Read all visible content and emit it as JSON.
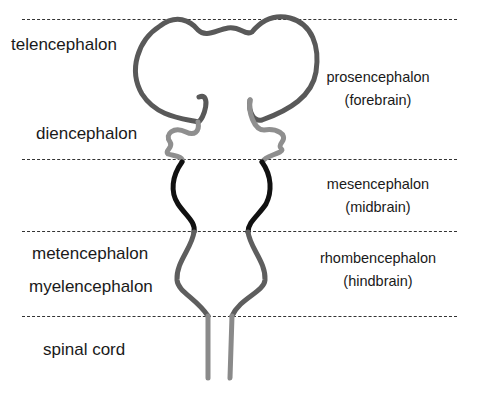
{
  "left_labels": {
    "telencephalon": "telencephalon",
    "diencephalon": "diencephalon",
    "metencephalon": "metencephalon",
    "myelencephalon": "myelencephalon",
    "spinal_cord": "spinal cord"
  },
  "right_labels": {
    "prosencephalon": {
      "name": "prosencephalon",
      "common": "(forebrain)"
    },
    "mesencephalon": {
      "name": "mesencephalon",
      "common": "(midbrain)"
    },
    "rhombencephalon": {
      "name": "rhombencephalon",
      "common": "(hindbrain)"
    }
  },
  "colors": {
    "forebrain": "#595959",
    "diencephalon": "#8f8f8f",
    "midbrain": "#111111",
    "hindbrain": "#5e5e5e",
    "spinal_cord": "#8a8a8a",
    "divider": "#333333"
  }
}
